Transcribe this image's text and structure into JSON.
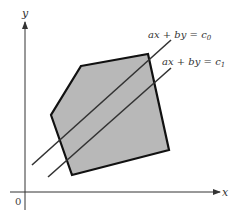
{
  "figure": {
    "axes": {
      "x_label": "x",
      "y_label": "y",
      "origin_label": "0",
      "origin": [
        25,
        192
      ],
      "x_end": [
        220,
        192
      ],
      "y_end": [
        25,
        22
      ]
    },
    "polygon": {
      "fill": "#b8b8b8",
      "stroke": "#111111",
      "vertices": [
        [
          81,
          66
        ],
        [
          148,
          54
        ],
        [
          169,
          150
        ],
        [
          72,
          175
        ],
        [
          51,
          115
        ]
      ]
    },
    "level_lines": [
      {
        "label": "ax + by = c₀",
        "label_main": "ax + by = c",
        "subscript": "0",
        "from": [
          32,
          165
        ],
        "to": [
          171,
          40
        ],
        "label_pos": [
          148,
          38
        ]
      },
      {
        "label": "ax + by = c₁",
        "label_main": "ax + by = c",
        "subscript": "1",
        "from": [
          48,
          177
        ],
        "to": [
          171,
          68
        ],
        "label_pos": [
          162,
          65
        ]
      }
    ],
    "line_color": "#333333"
  }
}
